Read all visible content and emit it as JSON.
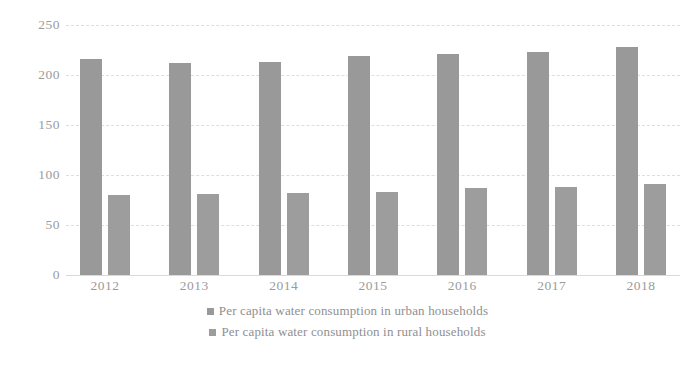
{
  "chart_data": {
    "type": "bar",
    "title": "",
    "subtitle": "",
    "xlabel": "",
    "ylabel": "",
    "categories": [
      "2012",
      "2013",
      "2014",
      "2015",
      "2016",
      "2017",
      "2018"
    ],
    "series": [
      {
        "name": "Per capita water consumption in urban households",
        "color": "#999999",
        "values": [
          216,
          212,
          213,
          219,
          221,
          223,
          228
        ]
      },
      {
        "name": "Per capita water consumption in rural households",
        "color": "#9d9d9d",
        "values": [
          80,
          81,
          82,
          83,
          87,
          88,
          91
        ]
      }
    ],
    "ylim": [
      0,
      250
    ],
    "ytick_labels": [
      "0",
      "50",
      "100",
      "150",
      "200",
      "250"
    ],
    "ytick_values": [
      0,
      50,
      100,
      150,
      200,
      250
    ],
    "grid": true,
    "grid_axis": "y",
    "grid_style": "dashed",
    "legend_position": "bottom"
  },
  "colors": {
    "bar_urban": "#999999",
    "bar_rural": "#9d9d9d",
    "gridline": "#dedede",
    "axis_text": "#9b9b9b",
    "legend_text": "#8f8f8f",
    "background": "#ffffff"
  }
}
